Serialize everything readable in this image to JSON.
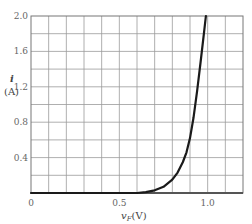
{
  "chart_data": {
    "type": "line",
    "title": "",
    "xlabel": "v_F (V)",
    "ylabel": "i (A)",
    "xlabel_main": "v",
    "xlabel_sub": "F",
    "xlabel_unit": "(V)",
    "ylabel_main": "i",
    "ylabel_unit": "(A)",
    "xlim": [
      0,
      1.2
    ],
    "ylim": [
      0,
      2.0
    ],
    "grid": true,
    "grid_x_step": 0.1,
    "grid_y_step": 0.2,
    "x_ticks": [
      {
        "value": 0,
        "label": "0"
      },
      {
        "value": 0.5,
        "label": "0.5"
      },
      {
        "value": 1.0,
        "label": "1.0"
      }
    ],
    "y_ticks": [
      {
        "value": 0.4,
        "label": "0.4"
      },
      {
        "value": 0.8,
        "label": "0.8"
      },
      {
        "value": 1.2,
        "label": "1.2"
      },
      {
        "value": 1.6,
        "label": "1.6"
      },
      {
        "value": 2.0,
        "label": "2.0"
      }
    ],
    "series": [
      {
        "name": "diode forward characteristic",
        "color": "#1a1a1a",
        "x": [
          0.0,
          0.6,
          0.65,
          0.7,
          0.75,
          0.8,
          0.83,
          0.86,
          0.88,
          0.9,
          0.92,
          0.94,
          0.96,
          0.98,
          0.99
        ],
        "y": [
          0.0,
          0.0,
          0.01,
          0.03,
          0.07,
          0.15,
          0.23,
          0.35,
          0.46,
          0.62,
          0.85,
          1.15,
          1.48,
          1.82,
          2.0
        ]
      }
    ]
  },
  "style": {
    "grid_color": "#9a9a9a",
    "frame_color": "#777777",
    "axis_color": "#555555"
  }
}
